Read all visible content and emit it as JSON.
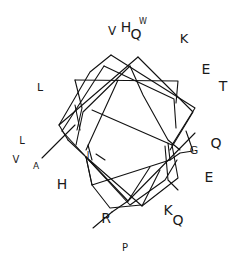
{
  "diagram": {
    "type": "helical-wheel",
    "background": "#ffffff",
    "line_color": "#111111",
    "residues": [
      {
        "label": "V",
        "x": 112,
        "y": 31,
        "size": 12
      },
      {
        "label": "H",
        "x": 126,
        "y": 27,
        "size": 14
      },
      {
        "label": "Q",
        "x": 136,
        "y": 34,
        "size": 14
      },
      {
        "label": "W",
        "x": 143,
        "y": 22,
        "size": 8
      },
      {
        "label": "K",
        "x": 184,
        "y": 38,
        "size": 13
      },
      {
        "label": "E",
        "x": 206,
        "y": 69,
        "size": 14
      },
      {
        "label": "T",
        "x": 223,
        "y": 86,
        "size": 14
      },
      {
        "label": "L",
        "x": 40,
        "y": 87,
        "size": 11
      },
      {
        "label": "Q",
        "x": 216,
        "y": 143,
        "size": 14
      },
      {
        "label": "G",
        "x": 194,
        "y": 150,
        "size": 11
      },
      {
        "label": "E",
        "x": 209,
        "y": 177,
        "size": 14
      },
      {
        "label": "L",
        "x": 22,
        "y": 141,
        "size": 10
      },
      {
        "label": "V",
        "x": 16,
        "y": 160,
        "size": 10
      },
      {
        "label": "A",
        "x": 36,
        "y": 166,
        "size": 9
      },
      {
        "label": "H",
        "x": 62,
        "y": 184,
        "size": 14
      },
      {
        "label": "I",
        "x": 88,
        "y": 155,
        "size": 9
      },
      {
        "label": "R",
        "x": 106,
        "y": 218,
        "size": 14
      },
      {
        "label": "K",
        "x": 168,
        "y": 210,
        "size": 14
      },
      {
        "label": "Q",
        "x": 178,
        "y": 220,
        "size": 14
      },
      {
        "label": "P",
        "x": 125,
        "y": 248,
        "size": 10
      }
    ]
  }
}
